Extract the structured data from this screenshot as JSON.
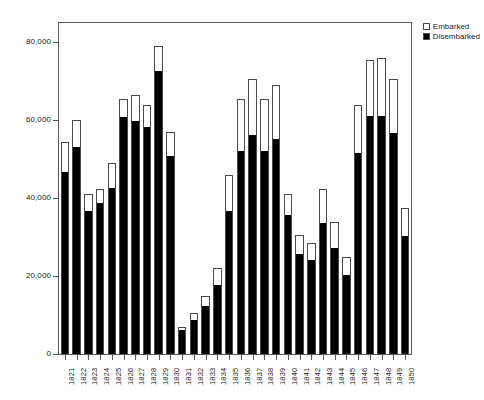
{
  "chart_data": {
    "type": "bar",
    "subtype": "stacked-vertical",
    "title": "",
    "subtitle": "",
    "xlabel": "",
    "ylabel": "",
    "ylim": [
      0,
      85000
    ],
    "yticks": [
      0,
      20000,
      40000,
      60000,
      80000
    ],
    "ytick_labels": [
      "0",
      "20,000",
      "40,000",
      "60,000",
      "80,000"
    ],
    "grid": false,
    "legend_position": "top-right",
    "legend": [
      "Embarked",
      "Disembarked"
    ],
    "categories": [
      "1821",
      "1822",
      "1823",
      "1824",
      "1825",
      "1826",
      "1827",
      "1828",
      "1829",
      "1830",
      "1831",
      "1832",
      "1833",
      "1834",
      "1835",
      "1836",
      "1837",
      "1838",
      "1839",
      "1840",
      "1841",
      "1842",
      "1843",
      "1844",
      "1845",
      "1846",
      "1847",
      "1848",
      "1849",
      "1850"
    ],
    "series": [
      {
        "name": "Disembarked",
        "color": "#000000",
        "values": [
          47000,
          53500,
          37000,
          39000,
          43000,
          61000,
          60000,
          58500,
          73000,
          51000,
          6500,
          9000,
          12500,
          18000,
          37000,
          52500,
          56500,
          52500,
          55500,
          36000,
          26000,
          24500,
          34000,
          27500,
          20500,
          52000,
          61500,
          61500,
          57000,
          30500
        ]
      },
      {
        "name": "Embarked",
        "color": "#ffffff",
        "values": [
          7500,
          6500,
          4000,
          3500,
          6000,
          4500,
          6500,
          5500,
          6000,
          6000,
          500,
          1500,
          2500,
          4000,
          9000,
          13000,
          14000,
          13000,
          13500,
          5000,
          4500,
          4000,
          8500,
          6500,
          4500,
          12000,
          14000,
          14500,
          13500,
          7000
        ]
      }
    ],
    "totals": [
      54500,
      60000,
      41000,
      42500,
      49000,
      65500,
      66500,
      64000,
      79000,
      57000,
      7000,
      10500,
      15000,
      22000,
      46000,
      65500,
      70500,
      65500,
      69000,
      41000,
      30500,
      28500,
      42500,
      34000,
      25000,
      64000,
      75500,
      76000,
      70500,
      37500
    ]
  },
  "legend": {
    "items": [
      {
        "label": "Embarked",
        "swatch": "white-square"
      },
      {
        "label": "Disembarked",
        "swatch": "black-square"
      }
    ]
  },
  "axes": {
    "y": {
      "tick_labels": [
        "80,000",
        "60,000",
        "40,000",
        "20,000",
        "0"
      ]
    }
  }
}
